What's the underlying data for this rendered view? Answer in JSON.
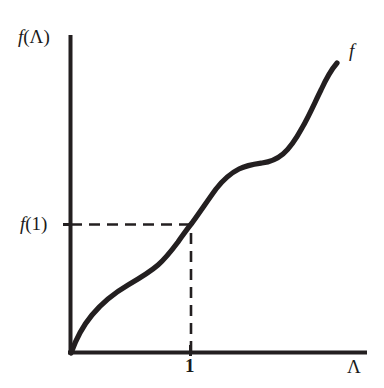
{
  "figure": {
    "background_color": "#ffffff",
    "ink_color": "#231f20"
  },
  "labels": {
    "y_axis": "f(Λ)",
    "x_axis": "Λ",
    "curve": "f",
    "y_tick": "f(1)",
    "x_tick": "1"
  },
  "chart_data": {
    "type": "line",
    "title": "",
    "subtitle": "",
    "xlabel": "Λ",
    "ylabel": "f(Λ)",
    "grid": false,
    "legend": null,
    "annotations": [
      {
        "name": "curve-label",
        "text": "f",
        "x": 1.93,
        "y": 3.46
      },
      {
        "name": "horizontal-dashed-guide",
        "text": "f(1)",
        "from": [
          0.0,
          1.32
        ],
        "to": [
          1.0,
          1.32
        ],
        "style": "dashed"
      },
      {
        "name": "vertical-dashed-guide",
        "text": "1",
        "from": [
          1.0,
          0.0
        ],
        "to": [
          1.0,
          1.32
        ],
        "style": "dashed"
      }
    ],
    "xlim": [
      0,
      2.1
    ],
    "ylim": [
      0,
      3.7
    ],
    "x_ticks": [
      1
    ],
    "x_tick_labels": [
      "1"
    ],
    "y_ticks": [
      1.32
    ],
    "y_tick_labels": [
      "f(1)"
    ],
    "series": [
      {
        "name": "f",
        "description": "Monotonically increasing staircase-like curve with two inflection plateaus",
        "x": [
          0.0,
          0.1,
          0.2,
          0.3,
          0.4,
          0.5,
          0.6,
          0.7,
          0.8,
          0.9,
          1.0,
          1.1,
          1.2,
          1.3,
          1.4,
          1.5,
          1.6,
          1.7,
          1.8,
          1.9,
          2.0
        ],
        "y": [
          0.0,
          0.42,
          0.62,
          0.74,
          0.82,
          0.88,
          0.94,
          1.01,
          1.11,
          1.22,
          1.32,
          1.55,
          1.79,
          1.96,
          2.05,
          2.12,
          2.24,
          2.49,
          2.82,
          3.1,
          3.23
        ]
      }
    ]
  }
}
